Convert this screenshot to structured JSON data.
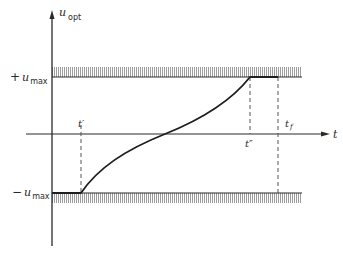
{
  "diagram": {
    "y_axis_label": "u",
    "y_axis_label_sub": "opt",
    "x_axis_label": "t",
    "upper_bound_sign": "+",
    "upper_bound_label": "u",
    "upper_bound_sub": "max",
    "lower_bound_sign": "−",
    "lower_bound_label": "u",
    "lower_bound_sub": "max",
    "t_prime": "t′",
    "t_double_prime": "t″",
    "t_final": "t",
    "t_final_sub": "f",
    "colors": {
      "line": "#2a2a2a",
      "hatch": "#8a8a8a",
      "background": "#ffffff"
    }
  }
}
